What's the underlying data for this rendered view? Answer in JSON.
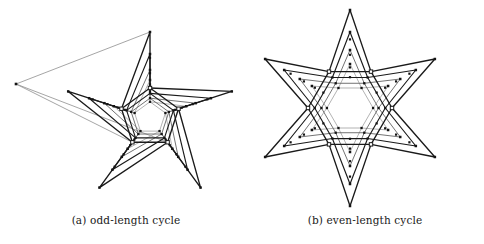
{
  "figure": {
    "width": 484,
    "height": 244,
    "background": "#ffffff",
    "ink_dark": "#1a1a1a",
    "ink_light": "#8e8e8e",
    "marker_fill": "#141414",
    "hub_fill": "#ffffff"
  },
  "panels": [
    {
      "id": "panel-a",
      "caption": "(a) odd-length cycle",
      "graph_name": "odd-length-cycle-star",
      "type": "star-graph",
      "points": 5,
      "cycle_parity": "odd",
      "center": {
        "x": 150,
        "y": 118
      },
      "hub_radius": 30,
      "hub_rotation": -90,
      "spike_rotation": -90,
      "layers": [
        {
          "index": 0,
          "spike_radius": 86,
          "hub_scale": 1.0,
          "stroke": "#1a1a1a",
          "width": 1.35,
          "dots": 1
        },
        {
          "index": 1,
          "spike_radius": 64,
          "hub_scale": 0.82,
          "stroke": "#1a1a1a",
          "width": 1.15,
          "dots": 1
        },
        {
          "index": 2,
          "spike_radius": 48,
          "hub_scale": 0.66,
          "stroke": "#636363",
          "width": 0.9,
          "dots": 1
        },
        {
          "index": 3,
          "spike_radius": 38,
          "hub_scale": 0.54,
          "stroke": "#9a9a9a",
          "width": 0.75,
          "dots": 1
        }
      ],
      "outlier": {
        "name": "far-left-tip",
        "x": 16,
        "y": 84,
        "stroke": "#8e8e8e",
        "width": 0.8,
        "connect_spikes": [
          2,
          3
        ]
      }
    },
    {
      "id": "panel-b",
      "caption": "(b) even-length cycle",
      "graph_name": "even-length-cycle-star",
      "type": "star-graph",
      "points": 6,
      "cycle_parity": "even",
      "center": {
        "x": 350,
        "y": 108
      },
      "hub_radius": 42,
      "hub_rotation": -60,
      "spike_rotation": -90,
      "layers": [
        {
          "index": 0,
          "spike_radius": 98,
          "hub_scale": 1.0,
          "stroke": "#1a1a1a",
          "width": 1.35,
          "dots": 1
        },
        {
          "index": 1,
          "spike_radius": 76,
          "hub_scale": 0.84,
          "stroke": "#1a1a1a",
          "width": 1.15,
          "dots": 1
        },
        {
          "index": 2,
          "spike_radius": 58,
          "hub_scale": 0.68,
          "stroke": "#636363",
          "width": 0.9,
          "dots": 1
        },
        {
          "index": 3,
          "spike_radius": 44,
          "hub_scale": 0.55,
          "stroke": "#9a9a9a",
          "width": 0.75,
          "dots": 1
        }
      ],
      "outlier": null
    }
  ]
}
